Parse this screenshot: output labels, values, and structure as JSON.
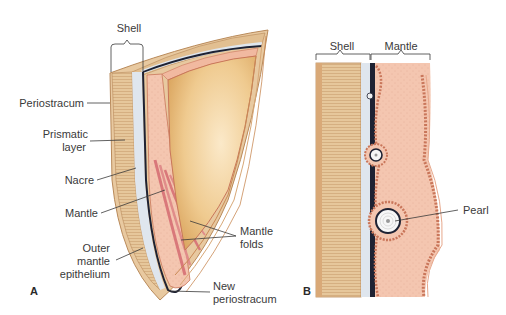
{
  "panels": [
    {
      "id": "A",
      "label": "A",
      "labels": {
        "shell": "Shell",
        "periostracum": "Periostracum",
        "prismatic_layer_1": "Prismatic",
        "prismatic_layer_2": "layer",
        "nacre": "Nacre",
        "mantle": "Mantle",
        "outer_mantle_1": "Outer",
        "outer_mantle_2": "mantle",
        "outer_mantle_3": "epithelium",
        "mantle_folds_1": "Mantle",
        "mantle_folds_2": "folds",
        "new_periostracum_1": "New",
        "new_periostracum_2": "periostracum"
      }
    },
    {
      "id": "B",
      "label": "B",
      "labels": {
        "shell": "Shell",
        "mantle": "Mantle",
        "pearl": "Pearl"
      }
    }
  ],
  "colors": {
    "shell_outer": "#e8c9a0",
    "prismatic": "#dfbd8f",
    "nacre": "#dfe6ee",
    "dark_line": "#1e2233",
    "mantle": "#f3c3ac",
    "mantle_edge": "#c9765a",
    "mantle_muscle": "#d9787a",
    "interior": "#e9b877",
    "label_text": "#3a3a3a"
  }
}
